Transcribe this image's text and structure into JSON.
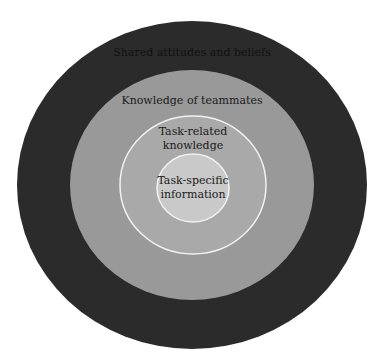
{
  "diagram": {
    "type": "concentric-circles",
    "layers": [
      {
        "id": "outer",
        "label": "Shared attitudes and beliefs",
        "color": "#2b2b2b",
        "text_color": "#111111"
      },
      {
        "id": "second",
        "label": "Knowledge of teammates",
        "color": "#999999",
        "text_color": "#1a1a1a"
      },
      {
        "id": "third",
        "label_lines": [
          "Task-related",
          "knowledge"
        ],
        "color": "#a9a9a9",
        "text_color": "#1a1a1a"
      },
      {
        "id": "center",
        "label_lines": [
          "Task-specific",
          "information"
        ],
        "color": "#c9c9c9",
        "text_color": "#1a1a1a"
      }
    ],
    "border_color": "#f2f2f2"
  }
}
